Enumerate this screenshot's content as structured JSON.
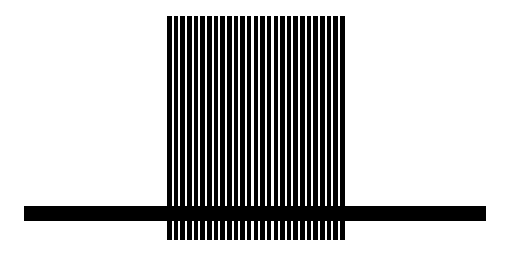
{
  "figure": {
    "background_color": "#ffffff",
    "foreground_color": "#000000",
    "stripes": {
      "count": 27,
      "left": 167,
      "top": 16,
      "width": 178,
      "height": 224,
      "stripe_width": 4.6,
      "gap_width": 2
    },
    "bar": {
      "left": 24,
      "top": 206,
      "width": 462,
      "height": 15
    }
  }
}
